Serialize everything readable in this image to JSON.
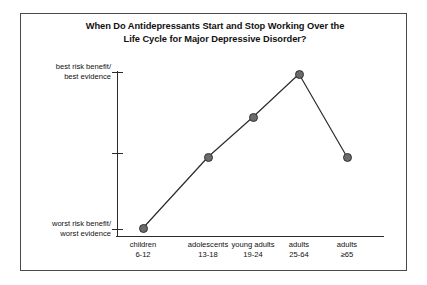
{
  "chart_data": {
    "type": "line",
    "title": "When Do Antidepressants Start and Stop Working Over the Life Cycle for Major Depressive Disorder?",
    "title_lines": [
      "When Do Antidepressants Start and Stop Working Over the",
      "Life Cycle for Major Depressive Disorder?"
    ],
    "xlabel": "",
    "ylabel": "",
    "grid": false,
    "legend": "none",
    "ylim": [
      0,
      3
    ],
    "y_tick_values": [
      0,
      1.5,
      3
    ],
    "y_axis_labels": [
      {
        "value": 3,
        "lines": [
          "best risk benefit/",
          "best evidence"
        ]
      },
      {
        "value": 0,
        "lines": [
          "worst risk benefit/",
          "worst evidence"
        ]
      }
    ],
    "categories": [
      {
        "name": "children",
        "range": "6-12"
      },
      {
        "name": "adolescents",
        "range": "13-18"
      },
      {
        "name": "young adults",
        "range": "19-24"
      },
      {
        "name": "adults",
        "range": "25-64"
      },
      {
        "name": "adults",
        "range": "≥65"
      }
    ],
    "x": [
      "children 6-12",
      "adolescents 13-18",
      "young adults 19-24",
      "adults 25-64",
      "adults ≥65"
    ],
    "values": [
      0,
      1.48,
      2.25,
      3,
      1.48
    ],
    "points": [
      {
        "label": "children 6-12",
        "value": 0,
        "px": 143,
        "py": 228
      },
      {
        "label": "adolescents 13-18",
        "value": 1.48,
        "px": 208,
        "py": 157
      },
      {
        "label": "young adults 19-24",
        "value": 2.25,
        "px": 253,
        "py": 117
      },
      {
        "label": "adults 25-64",
        "value": 3,
        "px": 299,
        "py": 74
      },
      {
        "label": "adults ≥65",
        "value": 1.48,
        "px": 347,
        "py": 157
      }
    ],
    "colors": {
      "marker_fill": "#6b6b6b",
      "marker_edge": "#333333",
      "line": "#2b2b2b",
      "axis": "#2b2b2b",
      "border": "#4a4a4a",
      "background": "#ffffff",
      "text": "#111111"
    },
    "axis_pixels": {
      "y_axis_x": 117,
      "y_axis_top": 71,
      "y_axis_bottom": 237,
      "x_axis_y": 236,
      "x_axis_left": 116,
      "x_axis_right": 384,
      "y_ticks_py": [
        72,
        153,
        229
      ]
    }
  }
}
